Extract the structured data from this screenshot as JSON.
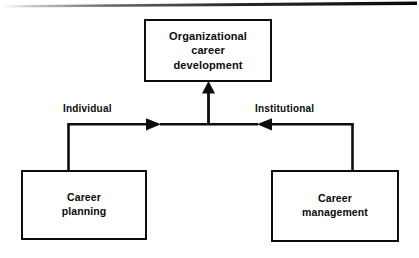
{
  "figure": {
    "background_color": "#ffffff",
    "line_color": "#0d0d0d",
    "text_color": "#0b0b0b"
  },
  "top_rule": {
    "name": "page-rule",
    "description": "horizontal scan rule across top of page"
  },
  "nodes": {
    "top": {
      "label": "Organizational\ncareer\ndevelopment",
      "line1": "Organizational",
      "line2": "career",
      "line3": "development"
    },
    "left": {
      "label": "Career\nplanning",
      "line1": "Career",
      "line2": "planning"
    },
    "right": {
      "label": "Career\nmanagement",
      "line1": "Career",
      "line2": "management"
    }
  },
  "edges": {
    "individual": {
      "label": "Individual",
      "from": "Career planning",
      "to": "Organizational career development",
      "direction": "right"
    },
    "institutional": {
      "label": "Institutional",
      "from": "Career management",
      "to": "Organizational career development",
      "direction": "left"
    },
    "center": {
      "label": "",
      "direction": "up"
    }
  }
}
